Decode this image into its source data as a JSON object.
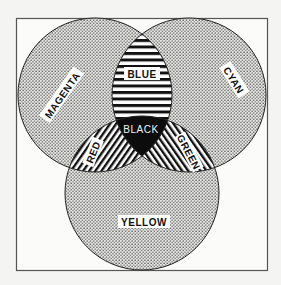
{
  "diagram": {
    "type": "venn",
    "title": "",
    "colors": {
      "background": "#f4f4f2",
      "frame": "#555555",
      "ink": "#111111",
      "label_bg": "#ffffff"
    },
    "circles": [
      {
        "id": "magenta",
        "label": "MAGENTA",
        "fill": "stipple"
      },
      {
        "id": "cyan",
        "label": "CYAN",
        "fill": "stipple"
      },
      {
        "id": "yellow",
        "label": "YELLOW",
        "fill": "stipple"
      }
    ],
    "intersections": [
      {
        "sets": [
          "magenta",
          "cyan"
        ],
        "label": "BLUE",
        "fill": "horizontal-stripes"
      },
      {
        "sets": [
          "magenta",
          "yellow"
        ],
        "label": "RED",
        "fill": "diagonal-stripes"
      },
      {
        "sets": [
          "cyan",
          "yellow"
        ],
        "label": "GREEN",
        "fill": "diagonal-stripes"
      },
      {
        "sets": [
          "magenta",
          "cyan",
          "yellow"
        ],
        "label": "BLACK",
        "fill": "solid-black"
      }
    ]
  }
}
